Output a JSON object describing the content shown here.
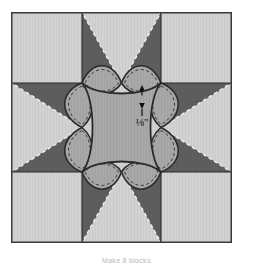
{
  "figure": {
    "type": "quilt-block-diagram",
    "caption": "Make 8 blocks."
  },
  "annotation": {
    "measurement_label": "⅛\"",
    "measurement_value": "1/8",
    "measurement_unit": "inch",
    "arrow_style": "double-headed-vertical"
  },
  "colors": {
    "background": "#ffffff",
    "light_fabric": "#d2d2d2",
    "medium_fabric": "#a8a8a8",
    "dark_fabric": "#5e5e5e",
    "outline": "#2b2b2b",
    "stitch_line": "#f2f2f2",
    "seam_dash": "#3a3a3a",
    "caption_text": "#b9b9b9"
  },
  "block": {
    "name": "Eight-pointed star with curved applique",
    "grid": "3x3",
    "size_px": 221,
    "units": [
      {
        "position": "top-left",
        "type": "corner-square",
        "fabric": "light_fabric"
      },
      {
        "position": "top-center",
        "type": "star-point",
        "fabric": "dark_fabric"
      },
      {
        "position": "top-right",
        "type": "corner-square",
        "fabric": "light_fabric"
      },
      {
        "position": "middle-left",
        "type": "star-point",
        "fabric": "dark_fabric"
      },
      {
        "position": "center",
        "type": "center-square",
        "fabric": "medium_fabric"
      },
      {
        "position": "middle-right",
        "type": "star-point",
        "fabric": "dark_fabric"
      },
      {
        "position": "bottom-left",
        "type": "corner-square",
        "fabric": "light_fabric"
      },
      {
        "position": "bottom-center",
        "type": "star-point",
        "fabric": "dark_fabric"
      },
      {
        "position": "bottom-right",
        "type": "corner-square",
        "fabric": "light_fabric"
      }
    ],
    "petals": [
      {
        "position": "top",
        "fabric": "medium_fabric"
      },
      {
        "position": "right",
        "fabric": "medium_fabric"
      },
      {
        "position": "bottom",
        "fabric": "medium_fabric"
      },
      {
        "position": "left",
        "fabric": "medium_fabric"
      }
    ],
    "stitch_lines": [
      {
        "position": "top-left-diagonal",
        "style": "dashed"
      },
      {
        "position": "top-right-diagonal",
        "style": "dashed"
      },
      {
        "position": "bottom-left-diagonal",
        "style": "dashed"
      },
      {
        "position": "bottom-right-diagonal",
        "style": "dashed"
      }
    ]
  }
}
